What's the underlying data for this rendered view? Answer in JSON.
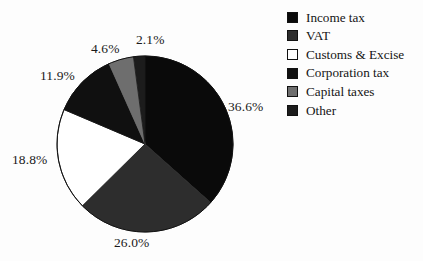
{
  "background_color": "#fdfdfd",
  "chart_data": {
    "type": "pie",
    "title": "",
    "subtitle": "",
    "xlabel": "",
    "ylabel": "",
    "grid": false,
    "legend_position": "right",
    "start_angle_deg": 0,
    "direction": "clockwise",
    "categories": [
      "Income tax",
      "VAT",
      "Customs & Excise",
      "Corporation tax",
      "Capital taxes",
      "Other"
    ],
    "values": [
      36.6,
      26.0,
      18.8,
      11.9,
      4.6,
      2.1
    ],
    "value_suffix": "%",
    "colors": [
      "#0a0a0a",
      "#2d2d2d",
      "#ffffff",
      "#101010",
      "#6e6e6e",
      "#1c1c1c"
    ],
    "slices": [
      {
        "label": "Income tax",
        "value": 36.6,
        "display": "36.6%",
        "color": "#0a0a0a"
      },
      {
        "label": "VAT",
        "value": 26.0,
        "display": "26.0%",
        "color": "#2d2d2d"
      },
      {
        "label": "Customs & Excise",
        "value": 18.8,
        "display": "18.8%",
        "color": "#ffffff"
      },
      {
        "label": "Corporation tax",
        "value": 11.9,
        "display": "11.9%",
        "color": "#101010"
      },
      {
        "label": "Capital taxes",
        "value": 4.6,
        "display": "4.6%",
        "color": "#6e6e6e"
      },
      {
        "label": "Other",
        "value": 2.1,
        "display": "2.1%",
        "color": "#1c1c1c"
      }
    ]
  },
  "pie": {
    "center_x": 145,
    "center_y": 144,
    "radius": 88,
    "outline_color": "#111111",
    "labels": [
      {
        "text": "36.6%",
        "x": 228,
        "y": 99
      },
      {
        "text": "26.0%",
        "x": 114,
        "y": 235
      },
      {
        "text": "18.8%",
        "x": 12,
        "y": 152
      },
      {
        "text": "11.9%",
        "x": 40,
        "y": 68
      },
      {
        "text": "4.6%",
        "x": 91,
        "y": 41
      },
      {
        "text": "2.1%",
        "x": 136,
        "y": 32
      }
    ]
  },
  "legend": {
    "items": [
      {
        "label": "Income tax",
        "color": "#0a0a0a"
      },
      {
        "label": "VAT",
        "color": "#2d2d2d"
      },
      {
        "label": "Customs & Excise",
        "color": "#ffffff"
      },
      {
        "label": "Corporation tax",
        "color": "#101010"
      },
      {
        "label": "Capital taxes",
        "color": "#6e6e6e"
      },
      {
        "label": "Other",
        "color": "#1c1c1c"
      }
    ]
  }
}
